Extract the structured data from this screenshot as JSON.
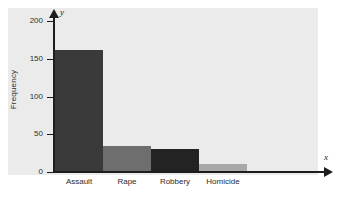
{
  "chart_data": {
    "type": "bar",
    "title": "",
    "subtitle": "",
    "xlabel": "x",
    "ylabel": "Frequency",
    "categories": [
      "Assault",
      "Rape",
      "Robbery",
      "Homicide"
    ],
    "values": [
      162,
      35,
      31,
      11
    ],
    "series": [
      {
        "name": "Frequency",
        "values": [
          162,
          35,
          31,
          11
        ]
      }
    ],
    "bar_colors": [
      "#3a3a3a",
      "#6e6e6e",
      "#232323",
      "#a8a8a8"
    ],
    "ylim": [
      0,
      215
    ],
    "xlim": [
      0,
      4
    ],
    "yticks": [
      0,
      50,
      100,
      150,
      200
    ],
    "ytick_labels": [
      "0",
      "50",
      "100",
      "150",
      "200"
    ],
    "grid": false,
    "legend": "none",
    "axis_variable_labels": {
      "x": "x",
      "y": "y"
    },
    "axis_style": "arrow-tipped",
    "plot_background": "#ebebeb",
    "figure_background": "#ffffff",
    "axis_color": "#1d1d1d"
  },
  "axes": {
    "y_title": "Frequency",
    "y_var": "y",
    "x_var": "x",
    "ticks": [
      {
        "label": "200",
        "value": 200
      },
      {
        "label": "150",
        "value": 150
      },
      {
        "label": "100",
        "value": 100
      },
      {
        "label": "50",
        "value": 50
      },
      {
        "label": "0",
        "value": 0
      }
    ]
  },
  "bars": [
    {
      "label": "Assault",
      "value": 162,
      "color": "#3a3a3a"
    },
    {
      "label": "Rape",
      "value": 35,
      "color": "#6e6e6e"
    },
    {
      "label": "Robbery",
      "value": 31,
      "color": "#232323"
    },
    {
      "label": "Homicide",
      "value": 11,
      "color": "#a8a8a8"
    }
  ]
}
